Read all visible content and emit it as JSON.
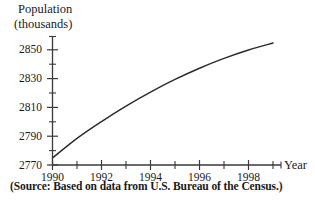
{
  "chart_data": {
    "type": "line",
    "title": "",
    "ylabel": "Population (thousands)",
    "ylabel_line1": "Population",
    "ylabel_line2": "(thousands)",
    "xlabel": "Year",
    "source_note": "(Source: Based on data from U.S. Bureau of the Census.)",
    "grid": false,
    "legend": "none",
    "xlim": [
      1990,
      1999
    ],
    "ylim": [
      2770,
      2862
    ],
    "y_major_ticks": [
      2770,
      2790,
      2810,
      2830,
      2850
    ],
    "y_major_tick_labels": [
      "2770",
      "2790",
      "2810",
      "2830",
      "2850"
    ],
    "y_minor_ticks": [
      2780,
      2800,
      2820,
      2840,
      2860
    ],
    "x_major_ticks": [
      1990,
      1992,
      1994,
      1996,
      1998
    ],
    "x_major_tick_labels": [
      "1990",
      "1992",
      "1994",
      "1996",
      "1998"
    ],
    "x_minor_ticks": [
      1991,
      1993,
      1995,
      1997,
      1999
    ],
    "x": [
      1990,
      1991,
      1992,
      1993,
      1994,
      1995,
      1996,
      1997,
      1998,
      1999
    ],
    "values": [
      2775,
      2789,
      2801,
      2812,
      2822,
      2831,
      2839,
      2846,
      2852,
      2857
    ],
    "series": [
      {
        "name": "Population",
        "values": [
          2775,
          2789,
          2801,
          2812,
          2822,
          2831,
          2839,
          2846,
          2852,
          2857
        ]
      }
    ],
    "line_color": "#2b2b2b"
  },
  "axes": {
    "axis_color": "#3a3a3a"
  }
}
